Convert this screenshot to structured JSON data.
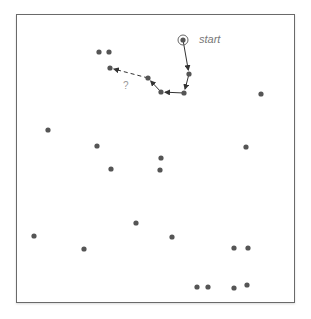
{
  "diagram": {
    "start_label": "start",
    "unknown_label": "?",
    "colors": {
      "dot": "#555555",
      "edge": "#333333",
      "frame": "#6a6a6a",
      "label": "#777777"
    },
    "start_point": [
      183,
      40
    ],
    "path": [
      [
        183,
        40
      ],
      [
        189,
        74
      ],
      [
        184,
        93
      ],
      [
        161,
        92
      ],
      [
        148,
        78
      ]
    ],
    "dashed_edge": [
      [
        148,
        78
      ],
      [
        110,
        68
      ]
    ],
    "points": [
      [
        99,
        52
      ],
      [
        109,
        52
      ],
      [
        110,
        68
      ],
      [
        261,
        94
      ],
      [
        48,
        130
      ],
      [
        97,
        146
      ],
      [
        111,
        169
      ],
      [
        161,
        158
      ],
      [
        160,
        170
      ],
      [
        246,
        147
      ],
      [
        34,
        236
      ],
      [
        84,
        249
      ],
      [
        136,
        223
      ],
      [
        172,
        237
      ],
      [
        234,
        248
      ],
      [
        248,
        248
      ],
      [
        197,
        287
      ],
      [
        208,
        287
      ],
      [
        234,
        288
      ],
      [
        247,
        285
      ]
    ]
  }
}
